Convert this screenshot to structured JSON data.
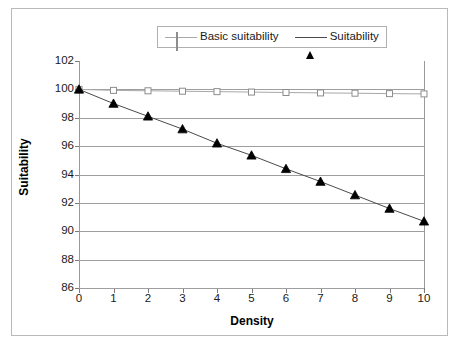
{
  "figure": {
    "background": "#ffffff",
    "frame_color": "#b9b9b9"
  },
  "legend": {
    "position": "top-center",
    "entries": [
      {
        "label": "Basic suitability",
        "marker": "open-square",
        "color": "#a8a8a8"
      },
      {
        "label": "Suitability",
        "marker": "filled-triangle",
        "color": "#000000"
      }
    ]
  },
  "axes": {
    "xlabel": "Density",
    "ylabel": "Suitability",
    "yticks": [
      "102",
      "100",
      "98",
      "96",
      "94",
      "92",
      "90",
      "88",
      "86"
    ],
    "xticks": [
      "0",
      "1",
      "2",
      "3",
      "4",
      "5",
      "6",
      "7",
      "8",
      "9",
      "10"
    ]
  },
  "chart_data": {
    "type": "line",
    "title": "",
    "subtitle": "",
    "xlabel": "Density",
    "ylabel": "Suitability",
    "xlim": [
      0,
      10
    ],
    "ylim": [
      86,
      102
    ],
    "ytick_step": 2,
    "xtick_step": 1,
    "grid": "horizontal",
    "legend_position": "top-center",
    "x": [
      0,
      1,
      2,
      3,
      4,
      5,
      6,
      7,
      8,
      9,
      10
    ],
    "series": [
      {
        "name": "Basic suitability",
        "marker": "open-square",
        "line_color": "#a8a8a8",
        "marker_face": "#ffffff",
        "marker_edge": "#8d8d8d",
        "values": [
          100.0,
          99.93,
          99.9,
          99.87,
          99.84,
          99.81,
          99.78,
          99.75,
          99.73,
          99.7,
          99.68
        ]
      },
      {
        "name": "Suitability",
        "marker": "filled-triangle",
        "line_color": "#4a4a4a",
        "marker_face": "#000000",
        "marker_edge": "#000000",
        "values": [
          100.0,
          99.0,
          98.1,
          97.2,
          96.2,
          95.35,
          94.4,
          93.5,
          92.55,
          91.6,
          90.7
        ]
      }
    ],
    "annotations": []
  }
}
